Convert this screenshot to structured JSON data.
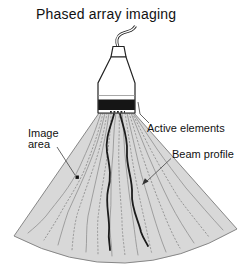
{
  "figure": {
    "title": "Phased array imaging",
    "labels": {
      "image_area": {
        "line1": "Image",
        "line2": "area"
      },
      "active_elements": "Active elements",
      "beam_profile": "Beam profile"
    },
    "colors": {
      "background": "#ffffff",
      "sector_fill": "#d8d8d8",
      "sector_border": "#878787",
      "beam_thin": "#979797",
      "beam_bold": "#1c1c1c",
      "active_band": "#151515",
      "probe_outline": "#222222",
      "text": "#111111"
    }
  }
}
